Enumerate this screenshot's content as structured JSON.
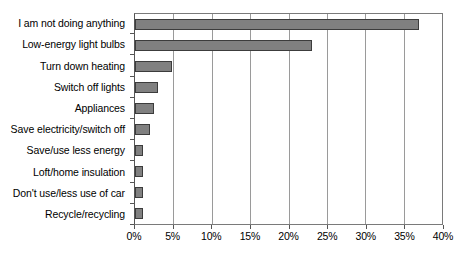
{
  "chart_data": {
    "type": "bar",
    "orientation": "horizontal",
    "title": "",
    "subtitle": "",
    "xlabel": "",
    "ylabel": "",
    "xlim": [
      0,
      40
    ],
    "xtick_step": 5,
    "xtick_labels": [
      "0%",
      "5%",
      "10%",
      "15%",
      "20%",
      "25%",
      "30%",
      "35%",
      "40%"
    ],
    "xtick_values": [
      0,
      5,
      10,
      15,
      20,
      25,
      30,
      35,
      40
    ],
    "grid": true,
    "grid_axis": "x",
    "legend": false,
    "legend_position": "none",
    "categories": [
      "I am not doing anything",
      "Low-energy light bulbs",
      "Turn down heating",
      "Switch off lights",
      "Appliances",
      "Save electricity/switch off",
      "Save/use less energy",
      "Loft/home insulation",
      "Don't use/less use of car",
      "Recycle/recycling"
    ],
    "values": [
      37,
      23,
      4.8,
      3,
      2.5,
      2,
      1,
      1.1,
      1.1,
      1
    ],
    "value_unit": "%",
    "colors": {
      "bar_fill": "#808080",
      "bar_border": "#3c3c3c",
      "gridline": "#9a9a9a",
      "axis": "#555555",
      "plot_border": "#7a7a7a",
      "background": "#ffffff",
      "text": "#000000"
    }
  }
}
